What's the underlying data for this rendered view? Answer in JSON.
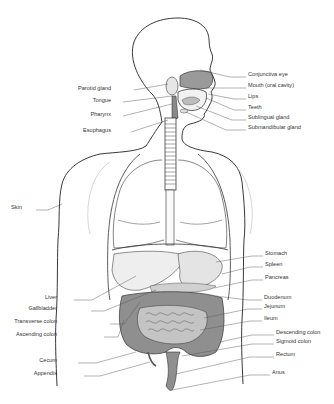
{
  "colors": {
    "outline": "#222222",
    "leader": "#555555",
    "organ_dark": "#8a8a8a",
    "organ_light": "#d8d8d8",
    "background": "#ffffff"
  },
  "labels_left": [
    {
      "id": "parotid-gland",
      "text": "Parotid gland",
      "x": 111,
      "y": 88
    },
    {
      "id": "tongue",
      "text": "Tongue",
      "x": 111,
      "y": 100
    },
    {
      "id": "pharynx",
      "text": "Pharynx",
      "x": 111,
      "y": 114
    },
    {
      "id": "esophagus",
      "text": "Esophagus",
      "x": 111,
      "y": 130
    },
    {
      "id": "skin",
      "text": "Skin",
      "x": 22,
      "y": 207
    },
    {
      "id": "liver",
      "text": "Liver",
      "x": 57,
      "y": 297
    },
    {
      "id": "gallbladder",
      "text": "Gallbladder",
      "x": 57,
      "y": 308
    },
    {
      "id": "transverse-colon",
      "text": "Transverse colon",
      "x": 57,
      "y": 321
    },
    {
      "id": "ascending-colon",
      "text": "Ascending colon",
      "x": 57,
      "y": 334
    },
    {
      "id": "cecum",
      "text": "Cecum",
      "x": 57,
      "y": 360
    },
    {
      "id": "appendix",
      "text": "Appendix",
      "x": 57,
      "y": 373
    }
  ],
  "labels_right": [
    {
      "id": "conjunctiva-eye",
      "text": "Conjunctiva eye",
      "x": 248,
      "y": 74
    },
    {
      "id": "mouth",
      "text": "Mouth (oral cavity)",
      "x": 248,
      "y": 85
    },
    {
      "id": "lips",
      "text": "Lips",
      "x": 248,
      "y": 96
    },
    {
      "id": "teeth",
      "text": "Teeth",
      "x": 248,
      "y": 107
    },
    {
      "id": "sublingual-gland",
      "text": "Sublingual gland",
      "x": 248,
      "y": 117
    },
    {
      "id": "submandibular-gland",
      "text": "Submandibular gland",
      "x": 248,
      "y": 127
    },
    {
      "id": "stomach",
      "text": "Stomach",
      "x": 265,
      "y": 253
    },
    {
      "id": "spleen",
      "text": "Spleen",
      "x": 265,
      "y": 264
    },
    {
      "id": "pancreas",
      "text": "Pancreas",
      "x": 265,
      "y": 277
    },
    {
      "id": "duodenum",
      "text": "Duodenum",
      "x": 264,
      "y": 297
    },
    {
      "id": "jejunum",
      "text": "Jejunum",
      "x": 264,
      "y": 306
    },
    {
      "id": "ileum",
      "text": "Ileum",
      "x": 264,
      "y": 318
    },
    {
      "id": "descending-colon",
      "text": "Descending colon",
      "x": 276,
      "y": 332
    },
    {
      "id": "sigmoid-colon",
      "text": "Sigmoid colon",
      "x": 276,
      "y": 341
    },
    {
      "id": "rectum",
      "text": "Rectum",
      "x": 276,
      "y": 354
    },
    {
      "id": "anus",
      "text": "Anus",
      "x": 272,
      "y": 372
    }
  ]
}
